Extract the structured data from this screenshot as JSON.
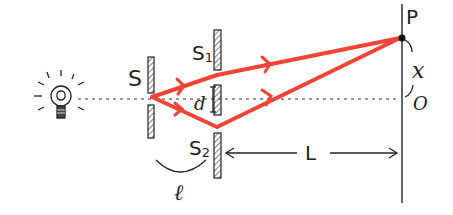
{
  "diagram": {
    "labels": {
      "source_slit": "S",
      "slit1": "S",
      "slit1_sub": "1",
      "slit2": "S",
      "slit2_sub": "2",
      "slit_separation": "d",
      "point_on_screen": "P",
      "displacement": "x",
      "origin": "O",
      "screen_distance": "L",
      "slit_distance": "ℓ"
    },
    "colors": {
      "ray": "#f04438",
      "ink": "#222222",
      "hatch": "#333333"
    },
    "elements": {
      "light_source": "light-bulb",
      "source_barrier": "single-slit barrier",
      "double_slit_barrier": "double-slit barrier",
      "screen": "observation screen"
    }
  }
}
